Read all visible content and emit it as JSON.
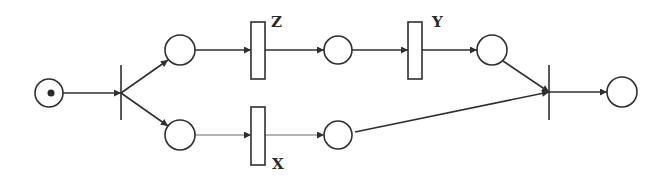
{
  "diagram": {
    "type": "petri-net",
    "colors": {
      "stroke": "#2f2f2f",
      "faint_stroke": "#8a8a8a",
      "background": "#ffffff"
    },
    "places": [
      {
        "id": "p_start",
        "cx": 49,
        "cy": 93,
        "r": 14,
        "tokens": 1
      },
      {
        "id": "p_top1",
        "cx": 180,
        "cy": 50,
        "r": 15,
        "tokens": 0
      },
      {
        "id": "p_bot1",
        "cx": 180,
        "cy": 135,
        "r": 15,
        "tokens": 0
      },
      {
        "id": "p_top2",
        "cx": 338,
        "cy": 50,
        "r": 14,
        "tokens": 0
      },
      {
        "id": "p_bot2",
        "cx": 338,
        "cy": 135,
        "r": 14,
        "tokens": 0
      },
      {
        "id": "p_top3",
        "cx": 492,
        "cy": 50,
        "r": 15,
        "tokens": 0
      },
      {
        "id": "p_end",
        "cx": 622,
        "cy": 92,
        "r": 15,
        "tokens": 0
      }
    ],
    "transitions": [
      {
        "id": "t_fork",
        "kind": "bar",
        "x": 121,
        "y1": 65,
        "y2": 120,
        "label": ""
      },
      {
        "id": "t_z",
        "kind": "box",
        "x": 251,
        "y": 22,
        "w": 14,
        "h": 57,
        "label": "Z"
      },
      {
        "id": "t_x",
        "kind": "box",
        "x": 251,
        "y": 107,
        "w": 14,
        "h": 58,
        "label": "X"
      },
      {
        "id": "t_y",
        "kind": "box",
        "x": 408,
        "y": 22,
        "w": 14,
        "h": 57,
        "label": "Y"
      },
      {
        "id": "t_join",
        "kind": "bar",
        "x": 549,
        "y1": 65,
        "y2": 120,
        "label": ""
      }
    ],
    "labels": {
      "z": "Z",
      "x": "X",
      "y": "Y"
    },
    "arcs": [
      {
        "from": "p_start",
        "to": "t_fork"
      },
      {
        "from": "t_fork",
        "to": "p_top1"
      },
      {
        "from": "t_fork",
        "to": "p_bot1"
      },
      {
        "from": "p_top1",
        "to": "t_z"
      },
      {
        "from": "p_bot1",
        "to": "t_x"
      },
      {
        "from": "t_z",
        "to": "p_top2"
      },
      {
        "from": "t_x",
        "to": "p_bot2"
      },
      {
        "from": "p_top2",
        "to": "t_y"
      },
      {
        "from": "t_y",
        "to": "p_top3"
      },
      {
        "from": "p_top3",
        "to": "t_join"
      },
      {
        "from": "p_bot2",
        "to": "t_join"
      },
      {
        "from": "t_join",
        "to": "p_end"
      }
    ]
  }
}
